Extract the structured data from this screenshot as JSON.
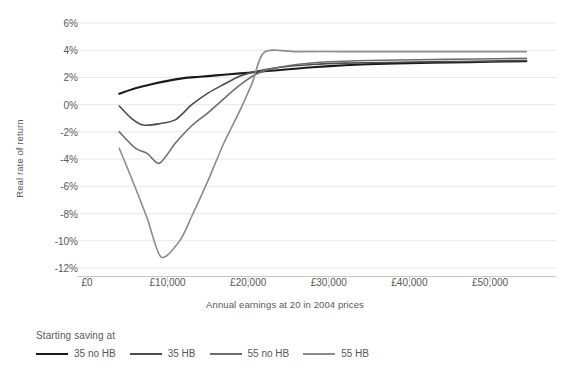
{
  "chart_data": {
    "type": "line",
    "title": "",
    "xlabel": "Annual earnings at 20 in 2004 prices",
    "ylabel": "Real rate of return",
    "xlim": [
      0,
      55000
    ],
    "ylim": [
      -12,
      6
    ],
    "grid": true,
    "legend_position": "bottom-left",
    "legend_title": "Starting saving at",
    "xtick_labels": [
      "£0",
      "£10,000",
      "£20,000",
      "£30,000",
      "£40,000",
      "£50,000"
    ],
    "xtick_values": [
      0,
      10000,
      20000,
      30000,
      40000,
      50000
    ],
    "ytick_labels": [
      "6%",
      "4%",
      "2%",
      "0%",
      "-2%",
      "-4%",
      "-6%",
      "-8%",
      "-10%",
      "-12%"
    ],
    "ytick_values": [
      6,
      4,
      2,
      0,
      -2,
      -4,
      -6,
      -8,
      -10,
      -12
    ],
    "series": [
      {
        "name": "35 no HB",
        "color": "#1a1a1a",
        "width": 2.1,
        "x": [
          4000,
          6000,
          8000,
          10000,
          12000,
          14000,
          16000,
          18000,
          20000,
          22000,
          25000,
          28000,
          32000,
          36000,
          40000,
          45000,
          50000,
          54500
        ],
        "values": [
          0.8,
          1.2,
          1.5,
          1.75,
          1.95,
          2.05,
          2.15,
          2.25,
          2.35,
          2.45,
          2.6,
          2.75,
          2.9,
          3.0,
          3.05,
          3.1,
          3.15,
          3.2
        ]
      },
      {
        "name": "35 HB",
        "color": "#4d4d4d",
        "width": 1.6,
        "x": [
          4000,
          5500,
          7000,
          9000,
          11000,
          13000,
          15000,
          17000,
          19000,
          21000,
          24000,
          28000,
          32000,
          37000,
          43000,
          50000,
          54500
        ],
        "values": [
          -0.1,
          -1.0,
          -1.5,
          -1.4,
          -1.1,
          0.0,
          0.85,
          1.5,
          2.1,
          2.45,
          2.75,
          2.95,
          3.05,
          3.1,
          3.15,
          3.2,
          3.25
        ]
      },
      {
        "name": "55 no HB",
        "color": "#6e6e6e",
        "width": 1.6,
        "x": [
          4000,
          6000,
          7500,
          9000,
          11000,
          13000,
          15000,
          17000,
          19000,
          21000,
          23000,
          26000,
          30000,
          35000,
          41000,
          48000,
          54500
        ],
        "values": [
          -2.0,
          -3.2,
          -3.6,
          -4.3,
          -2.8,
          -1.55,
          -0.6,
          0.45,
          1.45,
          2.25,
          2.65,
          2.95,
          3.15,
          3.25,
          3.3,
          3.35,
          3.4
        ]
      },
      {
        "name": "55 HB",
        "color": "#8c8c8c",
        "width": 1.6,
        "x": [
          4000,
          6000,
          7500,
          9200,
          11500,
          13000,
          15000,
          17000,
          19000,
          20500,
          22000,
          26000,
          32000,
          38000,
          45000,
          50000,
          54500
        ],
        "values": [
          -3.2,
          -6.1,
          -8.4,
          -11.2,
          -10.0,
          -8.2,
          -5.6,
          -2.8,
          -0.4,
          1.6,
          3.85,
          3.9,
          3.9,
          3.9,
          3.9,
          3.9,
          3.9
        ]
      }
    ]
  },
  "legend": {
    "title": "Starting saving at",
    "items": [
      {
        "label": "35 no HB"
      },
      {
        "label": "35 HB"
      },
      {
        "label": "55 no HB"
      },
      {
        "label": "55 HB"
      }
    ]
  },
  "axes": {
    "y_title": "Real rate of return",
    "x_title": "Annual earnings at 20 in 2004 prices"
  },
  "colors": {
    "grid": "#e8e8e8",
    "axis": "#c9c9c9",
    "text": "#58585a",
    "background": "#ffffff"
  }
}
